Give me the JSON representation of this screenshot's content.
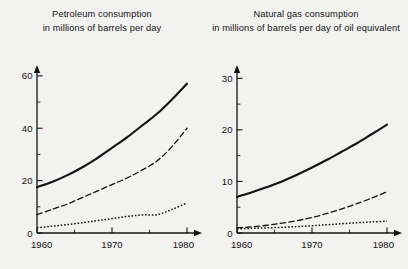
{
  "chart_data": [
    {
      "type": "line",
      "panel": "left",
      "title": "Petroleum consumption in millions of barrels per day",
      "title_lines": [
        "Petroleum consumption",
        "in millions of barrels per day"
      ],
      "xlabel": "",
      "ylabel": "",
      "xlim": [
        1960,
        1980
      ],
      "ylim": [
        0,
        63
      ],
      "grid": false,
      "legend_position": "none",
      "x_ticks_major": [
        "1960",
        "1970",
        "1980"
      ],
      "x_ticks_major_values": [
        1960,
        1970,
        1980
      ],
      "x_ticks_minor_values": [
        1965,
        1975
      ],
      "y_ticks_major": [
        "0",
        "20",
        "40",
        "60"
      ],
      "y_ticks_major_values": [
        0,
        20,
        40,
        60
      ],
      "y_ticks_minor_values": [
        10,
        30,
        50
      ],
      "x": [
        1960,
        1962,
        1964,
        1966,
        1968,
        1970,
        1972,
        1974,
        1976,
        1978,
        1980
      ],
      "series": [
        {
          "name": "solid-curve",
          "style": "solid",
          "width": 2.1,
          "values": [
            17.5,
            19.5,
            22.0,
            25.0,
            28.5,
            32.5,
            36.5,
            41.0,
            45.5,
            51.0,
            57.0
          ]
        },
        {
          "name": "dashed-curve",
          "style": "dashed",
          "width": 1.3,
          "values": [
            7.0,
            9.0,
            11.0,
            13.5,
            16.0,
            18.5,
            21.0,
            24.0,
            27.5,
            33.0,
            40.0
          ]
        },
        {
          "name": "dotted-curve",
          "style": "dotted",
          "width": 1.5,
          "values": [
            2.0,
            2.6,
            3.2,
            3.9,
            4.7,
            5.5,
            6.3,
            6.9,
            7.0,
            9.0,
            11.5
          ]
        }
      ]
    },
    {
      "type": "line",
      "panel": "right",
      "title": "Natural gas consumption in millions of barrels per day of oil equivalent",
      "title_lines": [
        "Natural gas consumption",
        "in millions of barrels per day of oil equivalent"
      ],
      "xlabel": "",
      "ylabel": "",
      "xlim": [
        1960,
        1980
      ],
      "ylim": [
        0,
        32
      ],
      "grid": false,
      "legend_position": "none",
      "x_ticks_major": [
        "1960",
        "1970",
        "1980"
      ],
      "x_ticks_major_values": [
        1960,
        1970,
        1980
      ],
      "x_ticks_minor_values": [
        1965,
        1975
      ],
      "y_ticks_major": [
        "0",
        "10",
        "20",
        "30"
      ],
      "y_ticks_major_values": [
        0,
        10,
        20,
        30
      ],
      "y_ticks_minor_values": [
        5,
        15,
        25
      ],
      "x": [
        1960,
        1962,
        1964,
        1966,
        1968,
        1970,
        1972,
        1974,
        1976,
        1978,
        1980
      ],
      "series": [
        {
          "name": "solid-curve",
          "style": "solid",
          "width": 2.1,
          "values": [
            7.0,
            7.9,
            8.9,
            10.0,
            11.3,
            12.7,
            14.2,
            15.8,
            17.4,
            19.2,
            21.0
          ]
        },
        {
          "name": "dashed-curve",
          "style": "dashed",
          "width": 1.3,
          "values": [
            1.0,
            1.2,
            1.5,
            1.9,
            2.4,
            3.0,
            3.8,
            4.7,
            5.7,
            6.8,
            8.0
          ]
        },
        {
          "name": "dotted-curve",
          "style": "dotted",
          "width": 1.5,
          "values": [
            0.8,
            0.9,
            1.0,
            1.1,
            1.25,
            1.4,
            1.6,
            1.8,
            2.0,
            2.15,
            2.3
          ]
        }
      ]
    }
  ],
  "colors": {
    "background": "#f2f2f0",
    "ink": "#141414",
    "axis": "#1a1a1a"
  }
}
